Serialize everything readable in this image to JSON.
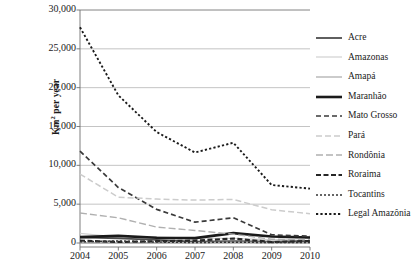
{
  "chart_data": {
    "type": "line",
    "title": "",
    "xlabel": "",
    "ylabel": "Km² per year",
    "ylabel_prefix": "Km",
    "ylabel_sup": "2",
    "ylabel_suffix": " per year",
    "x": [
      2004,
      2005,
      2006,
      2007,
      2008,
      2009,
      2010
    ],
    "xtick_labels": [
      "2004",
      "2005",
      "2006",
      "2007",
      "2008",
      "2009",
      "2010"
    ],
    "ytick_labels": [
      "0",
      "5,000",
      "10,000",
      "15,000",
      "20,000",
      "25,000",
      "30,000"
    ],
    "ytick_values": [
      0,
      5000,
      10000,
      15000,
      20000,
      25000,
      30000
    ],
    "ylim": [
      0,
      30000
    ],
    "xlim": [
      2004,
      2010
    ],
    "grid": "horizontal",
    "legend_position": "right",
    "series": [
      {
        "name": "Acre",
        "values": [
          728,
          592,
          398,
          184,
          254,
          167,
          259
        ],
        "color": "#4d4d4d",
        "width": 1.8,
        "dash": "none"
      },
      {
        "name": "Amazonas",
        "values": [
          1232,
          775,
          788,
          610,
          604,
          405,
          595
        ],
        "color": "#d0d0d0",
        "width": 1.2,
        "dash": "none"
      },
      {
        "name": "Amapá",
        "values": [
          46,
          33,
          30,
          39,
          100,
          70,
          53
        ],
        "color": "#a8a8a8",
        "width": 1.2,
        "dash": "none"
      },
      {
        "name": "Maranhão",
        "values": [
          755,
          922,
          674,
          631,
          1271,
          828,
          712
        ],
        "color": "#1a1a1a",
        "width": 2.6,
        "dash": "none"
      },
      {
        "name": "Mato Grosso",
        "values": [
          11814,
          7145,
          4333,
          2678,
          3258,
          1049,
          871
        ],
        "color": "#3a3a3a",
        "width": 1.7,
        "dash": "5,3"
      },
      {
        "name": "Pará",
        "values": [
          8870,
          5899,
          5659,
          5526,
          5607,
          4281,
          3770
        ],
        "color": "#cccccc",
        "width": 1.5,
        "dash": "6,3"
      },
      {
        "name": "Rondônia",
        "values": [
          3858,
          3244,
          2049,
          1611,
          1136,
          482,
          435
        ],
        "color": "#b0b0b0",
        "width": 1.4,
        "dash": "7,3"
      },
      {
        "name": "Roraima",
        "values": [
          311,
          133,
          231,
          309,
          574,
          121,
          256
        ],
        "color": "#262626",
        "width": 2.2,
        "dash": "5,2.5"
      },
      {
        "name": "Tocantins",
        "values": [
          158,
          271,
          124,
          63,
          107,
          61,
          49
        ],
        "color": "#333333",
        "width": 1.5,
        "dash": "2,2"
      },
      {
        "name": "Legal Amazônia",
        "values": [
          27772,
          19014,
          14286,
          11651,
          12911,
          7464,
          7000
        ],
        "color": "#1a1a1a",
        "width": 1.9,
        "dash": "2.2,2.2"
      }
    ]
  }
}
